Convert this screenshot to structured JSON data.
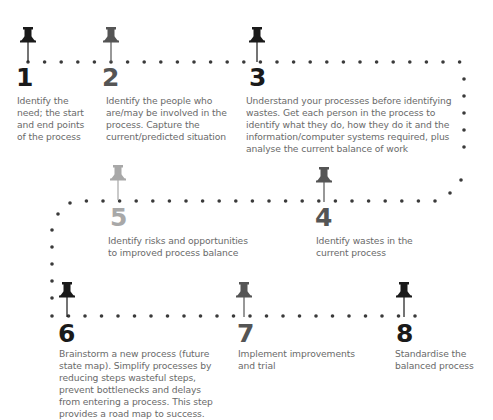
{
  "colors": {
    "dark": "#1a1a1a",
    "mid": "#555555",
    "light": "#a8a8a8",
    "dots": "#3a3a3a",
    "text": "#6a6a6a"
  },
  "steps": [
    {
      "number": "1",
      "text_lines": [
        "Identify the",
        "need; the start",
        "and end points",
        "of the process"
      ],
      "tone": "dark"
    },
    {
      "number": "2",
      "text_lines": [
        "Identify the people who",
        "are/may be involved in the",
        "process. Capture the",
        "current/predicted situation"
      ],
      "tone": "mid"
    },
    {
      "number": "3",
      "text_lines": [
        "Understand your processes before identifying",
        "wastes. Get each person in the process to",
        "identify what they do, how they do it and the",
        "information/computer systems required, plus",
        "analyse the current balance of work"
      ],
      "tone": "dark"
    },
    {
      "number": "4",
      "text_lines": [
        "Identify wastes in the",
        "current process"
      ],
      "tone": "mid"
    },
    {
      "number": "5",
      "text_lines": [
        "Identify risks and opportunities",
        "to improved process balance"
      ],
      "tone": "light"
    },
    {
      "number": "6",
      "text_lines": [
        "Brainstorm a new process (future",
        "state map). Simplify processes by",
        "reducing steps wasteful steps,",
        "prevent bottlenecks and delays",
        "from entering a process. This step",
        "provides a road map to success."
      ],
      "tone": "dark"
    },
    {
      "number": "7",
      "text_lines": [
        "Implement improvements",
        "and trial"
      ],
      "tone": "mid"
    },
    {
      "number": "8",
      "text_lines": [
        "Standardise the",
        "balanced process"
      ],
      "tone": "dark"
    }
  ]
}
